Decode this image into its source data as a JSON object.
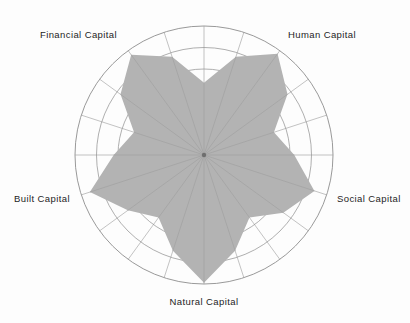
{
  "chart_data": {
    "type": "radar",
    "title": "",
    "subtitle": "",
    "xlabel": "",
    "ylabel": "",
    "grid": true,
    "legend": "none",
    "center": {
      "x": 204,
      "y": 155
    },
    "outer_radius": 129,
    "ring_count": 6,
    "ring_radii": [
      21.5,
      43,
      64.5,
      86,
      107.5,
      129
    ],
    "spoke_count": 20,
    "rmin": 0,
    "rmax": 100,
    "categories": [
      "Human Capital",
      "Social Capital",
      "Natural Capital",
      "Built Capital",
      "Financial Capital"
    ],
    "category_angles_deg": [
      54,
      -18,
      -90,
      198,
      126
    ],
    "series": [
      {
        "name": "Capital index",
        "fill_color": "#b3b3b3",
        "values": [
          97,
          90,
          99,
          93,
          96
        ]
      }
    ],
    "petal_minimum_fraction": 0.5,
    "annotations": [],
    "tick_labels": [],
    "points": [
      {
        "angle_deg": 90,
        "value": 56
      },
      {
        "angle_deg": 72,
        "value": 80
      },
      {
        "angle_deg": 54,
        "value": 97
      },
      {
        "angle_deg": 36,
        "value": 80
      },
      {
        "angle_deg": 18,
        "value": 57
      },
      {
        "angle_deg": 0,
        "value": 70
      },
      {
        "angle_deg": -18,
        "value": 90
      },
      {
        "angle_deg": -36,
        "value": 76
      },
      {
        "angle_deg": -54,
        "value": 60
      },
      {
        "angle_deg": -72,
        "value": 78
      },
      {
        "angle_deg": -90,
        "value": 99
      },
      {
        "angle_deg": -108,
        "value": 78
      },
      {
        "angle_deg": -126,
        "value": 60
      },
      {
        "angle_deg": -144,
        "value": 73
      },
      {
        "angle_deg": 198,
        "value": 93
      },
      {
        "angle_deg": 180,
        "value": 70
      },
      {
        "angle_deg": 162,
        "value": 57
      },
      {
        "angle_deg": 144,
        "value": 80
      },
      {
        "angle_deg": 126,
        "value": 96
      },
      {
        "angle_deg": 108,
        "value": 80
      }
    ]
  },
  "labels": {
    "financial": "Financial Capital",
    "human": "Human Capital",
    "social": "Social Capital",
    "built": "Built Capital",
    "natural": "Natural Capital"
  },
  "colors": {
    "fill": "#b3b3b3",
    "grid": "#8d8d8d",
    "spoke": "#9a9a9a",
    "text": "#1d1d1d",
    "background": "#fdfdfd"
  }
}
